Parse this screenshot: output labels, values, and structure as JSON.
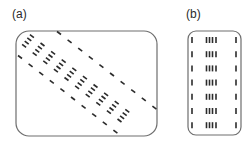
{
  "panels": [
    {
      "id": "a",
      "label": "(a)",
      "description": "Banded diagonal matrix: central band of 4-element groups, flanked by single-element off-diagonals",
      "frame": {
        "x": 16,
        "y": 31,
        "width": 141,
        "height": 105,
        "radius": 13
      },
      "orientation": "diagonal",
      "rows": 10
    },
    {
      "id": "b",
      "label": "(b)",
      "description": "Same structure re-ordered into columns: single column, 4-element group, single column",
      "frame": {
        "x": 188,
        "y": 31,
        "width": 53,
        "height": 104,
        "radius": 8
      },
      "orientation": "vertical",
      "rows": 7
    }
  ],
  "style": {
    "stroke_color": "#2b2b2b",
    "frame_color": "#6e6e6e",
    "label_color": "#2a2a2a"
  }
}
